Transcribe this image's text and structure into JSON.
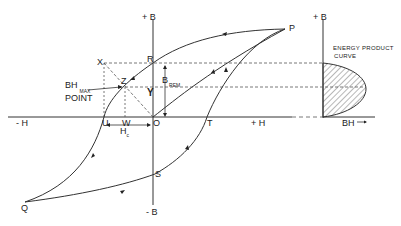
{
  "diagram": {
    "axes": {
      "main_vertical_top": "+ B",
      "main_vertical_bottom": "- B",
      "main_horizontal_left": "- H",
      "main_horizontal_right": "+ H",
      "right_vertical_top": "+ B",
      "right_horizontal": "BH"
    },
    "points": {
      "P": "P",
      "Q": "Q",
      "R": "R",
      "S": "S",
      "T": "T",
      "U": "U",
      "W": "W",
      "X": "X",
      "Y": "Y",
      "Z": "Z",
      "O": "O"
    },
    "annotations": {
      "bhmax_main": "BH",
      "bhmax_sub": "MAX",
      "bhmax_point": "POINT",
      "brem_main": "B",
      "brem_sub": "REM",
      "hc_main": "H",
      "hc_sub": "c",
      "energy_line1": "ENERGY PRODUCT",
      "energy_line2": "CURVE",
      "bh_arrow": "→"
    },
    "colors": {
      "line": "#222222",
      "background": "#ffffff"
    }
  }
}
